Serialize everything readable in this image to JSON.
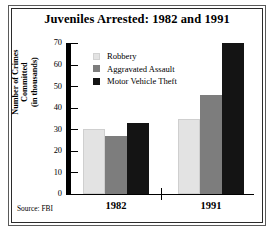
{
  "chart_data": {
    "type": "bar",
    "title": "Juveniles Arrested: 1982 and 1991",
    "xlabel": "",
    "ylabel": "Number of Crimes Committed (in thousands)",
    "ylabel_lines": [
      "Number of Crimes",
      "Committed",
      "(in thousands)"
    ],
    "categories": [
      "1982",
      "1991"
    ],
    "series": [
      {
        "name": "Robbery",
        "values": [
          30,
          35
        ],
        "color": "#e3e3e3"
      },
      {
        "name": "Aggravated Assault",
        "values": [
          27,
          46
        ],
        "color": "#7d7d7d"
      },
      {
        "name": "Motor Vehicle Theft",
        "values": [
          33,
          70
        ],
        "color": "#141414"
      }
    ],
    "ylim": [
      0,
      70
    ],
    "yticks": [
      0,
      10,
      20,
      30,
      40,
      50,
      60,
      70
    ],
    "ytick_labels": [
      "0",
      "10",
      "20",
      "30",
      "40",
      "50",
      "60",
      "70"
    ],
    "grid": false,
    "legend_position": "inside-top-left"
  },
  "source_note": "Source: FBI"
}
